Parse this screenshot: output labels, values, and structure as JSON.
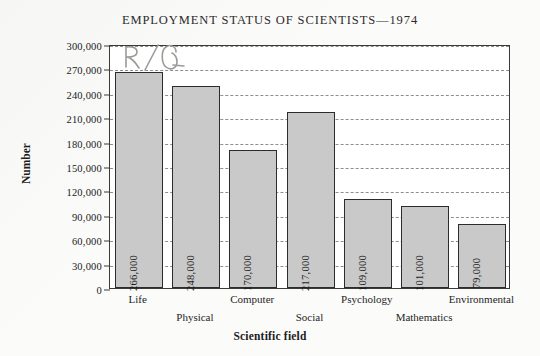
{
  "chart_data": {
    "type": "bar",
    "title": "EMPLOYMENT STATUS OF SCIENTISTS—1974",
    "xlabel": "Scientific field",
    "ylabel": "Number",
    "ylim": [
      0,
      300000
    ],
    "ytick_step": 30000,
    "grid": true,
    "legend": "none",
    "categories": [
      "Life",
      "Physical",
      "Computer",
      "Social",
      "Psychology",
      "Mathematics",
      "Environmental"
    ],
    "values": [
      266000,
      248000,
      170000,
      217000,
      109000,
      101000,
      79000
    ],
    "value_labels": [
      "266,000",
      "248,000",
      "170,000",
      "217,000",
      "109,000",
      "101,000",
      "79,000"
    ],
    "ytick_labels": [
      "0",
      "30,000",
      "60,000",
      "90,000",
      "120,000",
      "150,000",
      "180,000",
      "210,000",
      "240,000",
      "270,000",
      "300,000"
    ],
    "bar_fill_color": "#c9c9c9",
    "bar_edge_color": "#2c2c2c",
    "gridline_color": "#8e8e8e"
  },
  "annotation": {
    "handwritten_mark": "R/Q"
  }
}
